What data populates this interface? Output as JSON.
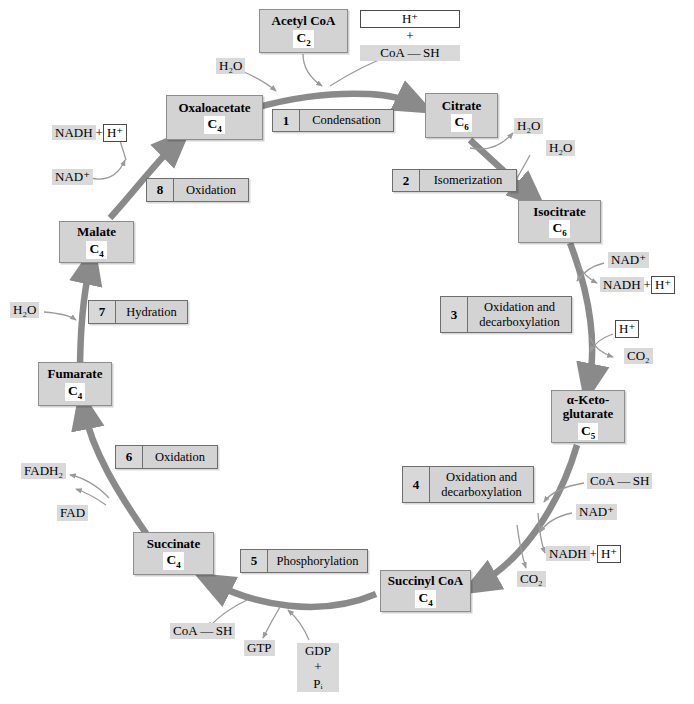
{
  "diagram": {
    "colors": {
      "box_fill": "#d3d3d3",
      "box_border": "#8d8d8d",
      "label_fill": "#d9d9d9",
      "arrow_main": "#8a8a8a",
      "arrow_thin": "#9a9a9a",
      "background": "#ffffff"
    }
  },
  "metabolites": [
    {
      "id": "acetyl-coa",
      "name": "Acetyl CoA",
      "carbon": "C",
      "carbon_sub": "2"
    },
    {
      "id": "oxaloacetate",
      "name": "Oxaloacetate",
      "carbon": "C",
      "carbon_sub": "4"
    },
    {
      "id": "citrate",
      "name": "Citrate",
      "carbon": "C",
      "carbon_sub": "6"
    },
    {
      "id": "isocitrate",
      "name": "Isocitrate",
      "carbon": "C",
      "carbon_sub": "6"
    },
    {
      "id": "alpha-ketoglutarate",
      "name_line1": "α-Keto-",
      "name_line2": "glutarate",
      "carbon": "C",
      "carbon_sub": "5"
    },
    {
      "id": "succinyl-coa",
      "name": "Succinyl CoA",
      "carbon": "C",
      "carbon_sub": "4"
    },
    {
      "id": "succinate",
      "name": "Succinate",
      "carbon": "C",
      "carbon_sub": "4"
    },
    {
      "id": "fumarate",
      "name": "Fumarate",
      "carbon": "C",
      "carbon_sub": "4"
    },
    {
      "id": "malate",
      "name": "Malate",
      "carbon": "C",
      "carbon_sub": "4"
    }
  ],
  "steps": [
    {
      "number": "1",
      "label": "Condensation"
    },
    {
      "number": "2",
      "label": "Isomerization"
    },
    {
      "number": "3",
      "label": "Oxidation and\ndecarboxylation"
    },
    {
      "number": "4",
      "label": "Oxidation and\ndecarboxylation"
    },
    {
      "number": "5",
      "label": "Phosphorylation"
    },
    {
      "number": "6",
      "label": "Oxidation"
    },
    {
      "number": "7",
      "label": "Hydration"
    },
    {
      "number": "8",
      "label": "Oxidation"
    }
  ],
  "molecules": {
    "h2o_top": "H₂O",
    "h2o_citrate_1": "H₂O",
    "h2o_citrate_2": "H₂O",
    "h2o_hydration": "H₂O",
    "hplus": "H⁺",
    "plus": "+",
    "coa_sh_top": "CoA — SH",
    "coa_sh_step4": "CoA — SH",
    "coa_sh_step5": "CoA — SH",
    "nad_plus_step3": "NAD⁺",
    "nadh_step3": "NADH",
    "nadh_plus_step3": "+",
    "hplus_step3": "H⁺",
    "hplus_co2_step3": "H⁺",
    "co2_step3": "CO₂",
    "nad_plus_step4": "NAD⁺",
    "nadh_step4": "NADH",
    "nadh_plus_step4": "+",
    "hplus_step4": "H⁺",
    "co2_step4": "CO₂",
    "gtp": "GTP",
    "gdp": "GDP",
    "gdp_plus": "+",
    "pi": "Pᵢ",
    "fadh2": "FADH₂",
    "fad": "FAD",
    "nadh_step8": "NADH",
    "nadh_plus_step8": "+",
    "hplus_step8": "H⁺",
    "nad_plus_step8": "NAD⁺"
  }
}
